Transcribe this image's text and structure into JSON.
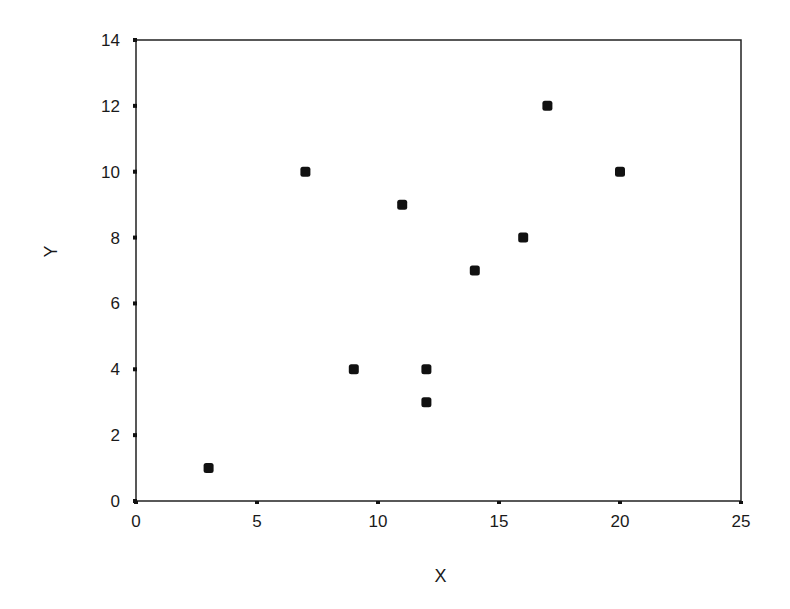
{
  "chart_data": {
    "type": "scatter",
    "title": "",
    "xlabel": "X",
    "ylabel": "Y",
    "xlim": [
      0,
      25
    ],
    "ylim": [
      0,
      14
    ],
    "xticks": [
      0,
      5,
      10,
      15,
      20,
      25
    ],
    "yticks": [
      0,
      2,
      4,
      6,
      8,
      10,
      12,
      14
    ],
    "grid": false,
    "legend": null,
    "series": [
      {
        "name": "data",
        "marker": "square",
        "color": "#111111",
        "points": [
          {
            "x": 3,
            "y": 1
          },
          {
            "x": 7,
            "y": 10
          },
          {
            "x": 9,
            "y": 4
          },
          {
            "x": 11,
            "y": 9
          },
          {
            "x": 12,
            "y": 4
          },
          {
            "x": 12,
            "y": 3
          },
          {
            "x": 14,
            "y": 7
          },
          {
            "x": 16,
            "y": 8
          },
          {
            "x": 17,
            "y": 12
          },
          {
            "x": 20,
            "y": 10
          }
        ]
      }
    ]
  },
  "layout": {
    "plot": {
      "left": 136,
      "right": 741,
      "top": 40,
      "bottom": 501
    },
    "axis_color": "#222222"
  }
}
